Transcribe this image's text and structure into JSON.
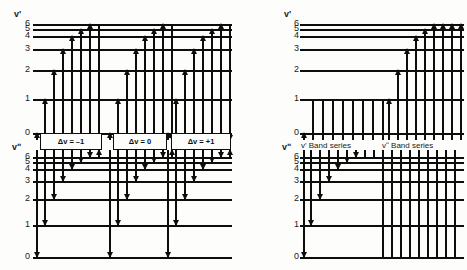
{
  "figure": {
    "type": "energy-level-transition-diagram"
  },
  "left_panel": {
    "upper_state": {
      "label": "v'",
      "levels": [
        "6",
        "5",
        "4",
        "3",
        "2",
        "1",
        "0"
      ]
    },
    "lower_state": {
      "label": "vʺ",
      "levels": [
        "6",
        "5",
        "4",
        "3",
        "2",
        "1",
        "0"
      ]
    },
    "groups": [
      {
        "name": "delta-v-minus-one",
        "label": "Δv = –1"
      },
      {
        "name": "delta-v-zero",
        "label": "Δv = 0"
      },
      {
        "name": "delta-v-plus-one",
        "label": "Δv = +1"
      }
    ]
  },
  "right_panel": {
    "upper_state": {
      "label": "v'",
      "levels": [
        "6",
        "5",
        "4",
        "3",
        "2",
        "1",
        "0"
      ]
    },
    "lower_state": {
      "label": "vʺ",
      "levels": [
        "6",
        "5",
        "4",
        "3",
        "2",
        "1",
        "0"
      ]
    },
    "series": [
      {
        "name": "v-prime-band-series",
        "label": "v' Band series"
      },
      {
        "name": "v-double-prime-band-series",
        "label": "vʺ Band series"
      }
    ]
  },
  "style": {
    "line_color": "#0d0d0d",
    "background": "#fdfdfb",
    "text_color": "#1a1a1a"
  },
  "chart_data": {
    "type": "diagram",
    "title": "",
    "panels": [
      {
        "id": "left",
        "upper_level_y": [
          24,
          29,
          36,
          49,
          70,
          99,
          133
        ],
        "lower_level_y": [
          157,
          162,
          169,
          181,
          199,
          225,
          257
        ],
        "level_indices": [
          6,
          5,
          4,
          3,
          2,
          1,
          0
        ],
        "groups": [
          "Δv = –1",
          "Δv = 0",
          "Δv = +1"
        ]
      },
      {
        "id": "right",
        "upper_level_y": [
          24,
          29,
          36,
          49,
          70,
          99,
          133
        ],
        "lower_level_y": [
          157,
          162,
          169,
          181,
          199,
          225,
          257
        ],
        "level_indices": [
          6,
          5,
          4,
          3,
          2,
          1,
          0
        ],
        "series": [
          "v' Band series",
          "vʺ Band series"
        ]
      }
    ]
  }
}
